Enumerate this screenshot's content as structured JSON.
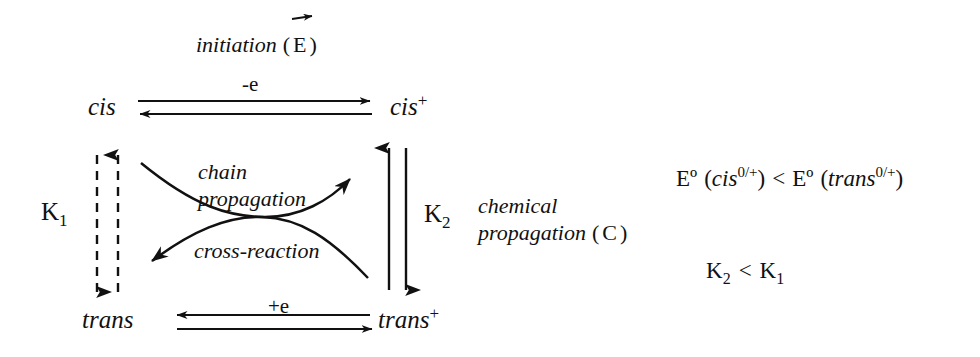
{
  "diagram": {
    "ink_color": "#111111",
    "background": "#ffffff",
    "species": {
      "cis_neutral": "cis",
      "cis_cation_base": "cis",
      "cis_cation_charge": "+",
      "trans_neutral": "trans",
      "trans_cation_base": "trans",
      "trans_cation_charge": "+"
    },
    "electrode_steps": {
      "top_label": "-e",
      "bottom_label": "+e",
      "initiation_text": "initiation",
      "initiation_paren_open": "(",
      "initiation_symbol": "E",
      "initiation_paren_close": ")",
      "initiation_vector_arrow": "right-arrow-accent"
    },
    "chemical_steps": {
      "chain_propagation_line1": "chain",
      "chain_propagation_line2": "propagation",
      "cross_reaction": "cross-reaction",
      "chemical_propagation_line1": "chemical",
      "chemical_propagation_line2_text": "propagation",
      "chemical_propagation_paren_open": "(",
      "chemical_propagation_symbol": "C",
      "chemical_propagation_paren_close": ")"
    },
    "equilibria": {
      "k1_base": "K",
      "k1_sub": "1",
      "k2_base": "K",
      "k2_sub": "2"
    },
    "relations": {
      "potential_line": {
        "e_left": "Eº",
        "paren_open_left": "(",
        "species_left": "cis",
        "sup_left": "0/+",
        "paren_close_left": ")",
        "operator": "<",
        "e_right": "Eº",
        "paren_open_right": "(",
        "species_right": "trans",
        "sup_right": "0/+",
        "paren_close_right": ")"
      },
      "constant_line": {
        "left_base": "K",
        "left_sub": "2",
        "operator": "<",
        "right_base": "K",
        "right_sub": "1"
      }
    }
  }
}
